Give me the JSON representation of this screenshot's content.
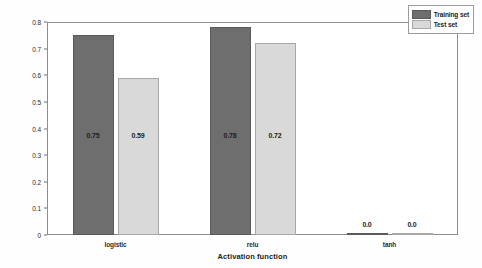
{
  "chart_data": {
    "type": "bar",
    "title": "",
    "xlabel": "Activation function",
    "ylabel": "",
    "categories": [
      "logistic",
      "relu",
      "tanh"
    ],
    "series": [
      {
        "name": "Training set",
        "color": "#6e6e6e",
        "values": [
          0.75,
          0.78,
          0.0
        ],
        "labels": [
          "0.75",
          "0.78",
          "0.0"
        ]
      },
      {
        "name": "Test set",
        "color": "#d9d9d9",
        "values": [
          0.59,
          0.72,
          0.0
        ],
        "labels": [
          "0.59",
          "0.72",
          "0.0"
        ]
      }
    ],
    "ylim": [
      0,
      0.8
    ],
    "yticks": [
      0,
      0.1,
      0.2,
      0.3,
      0.4,
      0.5,
      0.6,
      0.7,
      0.8
    ],
    "ytick_labels": [
      "0",
      "0.1",
      "0.2",
      "0.3",
      "0.4",
      "0.5",
      "0.6",
      "0.7",
      "0.8"
    ],
    "grid": false,
    "legend_position": "upper right"
  },
  "legend": {
    "items": [
      {
        "label": "Training set"
      },
      {
        "label": "Test set"
      }
    ]
  },
  "axis": {
    "xlabel": "Activation function"
  }
}
